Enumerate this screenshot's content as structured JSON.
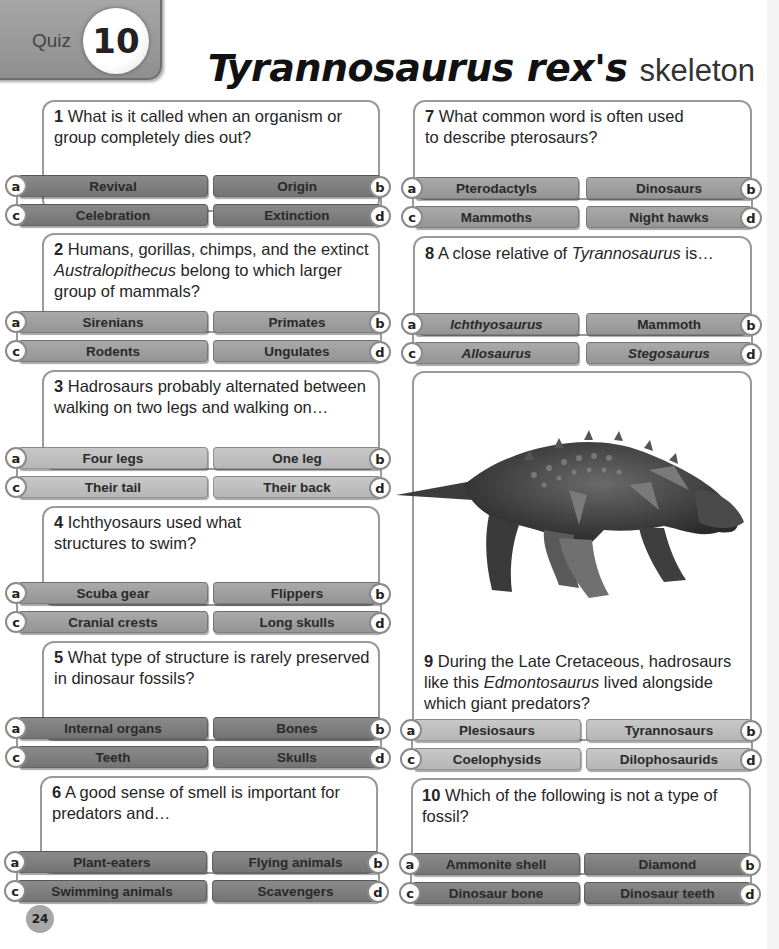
{
  "header": {
    "quiz_label": "Quiz",
    "quiz_number": "10",
    "title_bold": "Tyrannosaurus rex's",
    "title_light": "skeleton"
  },
  "questions": [
    {
      "number": "1",
      "text": "What is it called when an organism or group completely dies out?",
      "shade": "dark",
      "options": [
        {
          "letter": "a",
          "label": "Revival"
        },
        {
          "letter": "b",
          "label": "Origin"
        },
        {
          "letter": "c",
          "label": "Celebration"
        },
        {
          "letter": "d",
          "label": "Extinction"
        }
      ]
    },
    {
      "number": "2",
      "text_pre": "Humans, gorillas, chimps, and the extinct",
      "text_italic": "Australopithecus",
      "text_post": "belong to which larger group of mammals?",
      "shade": "mid",
      "options": [
        {
          "letter": "a",
          "label": "Sirenians"
        },
        {
          "letter": "b",
          "label": "Primates"
        },
        {
          "letter": "c",
          "label": "Rodents"
        },
        {
          "letter": "d",
          "label": "Ungulates"
        }
      ]
    },
    {
      "number": "3",
      "text": "Hadrosaurs probably alternated between walking on two legs and walking on…",
      "shade": "light",
      "options": [
        {
          "letter": "a",
          "label": "Four legs"
        },
        {
          "letter": "b",
          "label": "One leg"
        },
        {
          "letter": "c",
          "label": "Their tail"
        },
        {
          "letter": "d",
          "label": "Their back"
        }
      ]
    },
    {
      "number": "4",
      "text": "Ichthyosaurs used what structures to swim?",
      "shade": "mid",
      "options": [
        {
          "letter": "a",
          "label": "Scuba gear"
        },
        {
          "letter": "b",
          "label": "Flippers"
        },
        {
          "letter": "c",
          "label": "Cranial crests"
        },
        {
          "letter": "d",
          "label": "Long skulls"
        }
      ]
    },
    {
      "number": "5",
      "text": "What type of structure is rarely preserved in dinosaur fossils?",
      "shade": "dark",
      "options": [
        {
          "letter": "a",
          "label": "Internal organs"
        },
        {
          "letter": "b",
          "label": "Bones"
        },
        {
          "letter": "c",
          "label": "Teeth"
        },
        {
          "letter": "d",
          "label": "Skulls"
        }
      ]
    },
    {
      "number": "6",
      "text": "A good sense of smell is important for predators and…",
      "shade": "dark",
      "options": [
        {
          "letter": "a",
          "label": "Plant-eaters"
        },
        {
          "letter": "b",
          "label": "Flying animals"
        },
        {
          "letter": "c",
          "label": "Swimming animals"
        },
        {
          "letter": "d",
          "label": "Scavengers"
        }
      ]
    },
    {
      "number": "7",
      "text": "What common word is often used to describe pterosaurs?",
      "shade": "mid",
      "options": [
        {
          "letter": "a",
          "label": "Pterodactyls"
        },
        {
          "letter": "b",
          "label": "Dinosaurs"
        },
        {
          "letter": "c",
          "label": "Mammoths"
        },
        {
          "letter": "d",
          "label": "Night hawks"
        }
      ]
    },
    {
      "number": "8",
      "text_pre": "A close relative of",
      "text_italic": "Tyrannosaurus",
      "text_post": "is…",
      "shade": "mid",
      "options": [
        {
          "letter": "a",
          "label": "Ichthyosaurus"
        },
        {
          "letter": "b",
          "label": "Mammoth"
        },
        {
          "letter": "c",
          "label": "Allosaurus"
        },
        {
          "letter": "d",
          "label": "Stegosaurus"
        }
      ]
    },
    {
      "number": "9",
      "text_pre": "During the Late Cretaceous, hadrosaurs like this",
      "text_italic": "Edmontosaurus",
      "text_post": "lived alongside which giant predators?",
      "shade": "light",
      "image": "armored-dinosaur-illustration",
      "options": [
        {
          "letter": "a",
          "label": "Plesiosaurs"
        },
        {
          "letter": "b",
          "label": "Tyrannosaurs"
        },
        {
          "letter": "c",
          "label": "Coelophysids"
        },
        {
          "letter": "d",
          "label": "Dilophosaurids"
        }
      ]
    },
    {
      "number": "10",
      "text": "Which of the following is not a type of fossil?",
      "shade": "dark",
      "options": [
        {
          "letter": "a",
          "label": "Ammonite shell"
        },
        {
          "letter": "b",
          "label": "Diamond"
        },
        {
          "letter": "c",
          "label": "Dinosaur bone"
        },
        {
          "letter": "d",
          "label": "Dinosaur teeth"
        }
      ]
    }
  ],
  "footer": {
    "page_number": "24"
  },
  "colors": {
    "button_dark": "#7d7d7d",
    "button_mid": "#9f9f9f",
    "button_light": "#bfbfbf",
    "card_border": "#9a9a9a",
    "page_badge": "#a7a7a7"
  }
}
